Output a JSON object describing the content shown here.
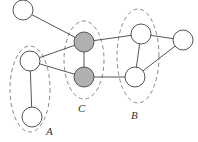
{
  "diagram": {
    "type": "graph",
    "nodes": [
      {
        "id": "n0",
        "x": 23,
        "y": 10,
        "r": 10,
        "fill": "#ffffff",
        "group": null
      },
      {
        "id": "a1",
        "x": 30,
        "y": 61,
        "r": 10,
        "fill": "#ffffff",
        "group": "A"
      },
      {
        "id": "a2",
        "x": 32,
        "y": 117,
        "r": 10,
        "fill": "#ffffff",
        "group": "A"
      },
      {
        "id": "c1",
        "x": 84,
        "y": 42,
        "r": 10,
        "fill": "#b0b0b0",
        "group": "C"
      },
      {
        "id": "c2",
        "x": 84,
        "y": 77,
        "r": 10,
        "fill": "#b0b0b0",
        "group": "C"
      },
      {
        "id": "b1",
        "x": 141,
        "y": 34,
        "r": 10,
        "fill": "#ffffff",
        "group": "B"
      },
      {
        "id": "b2",
        "x": 135,
        "y": 77,
        "r": 10,
        "fill": "#ffffff",
        "group": "B"
      },
      {
        "id": "n7",
        "x": 183,
        "y": 40,
        "r": 10,
        "fill": "#ffffff",
        "group": null
      }
    ],
    "edges": [
      [
        "n0",
        "c1"
      ],
      [
        "a1",
        "c1"
      ],
      [
        "a1",
        "c2"
      ],
      [
        "a1",
        "a2"
      ],
      [
        "c1",
        "c2"
      ],
      [
        "c1",
        "b1"
      ],
      [
        "c2",
        "b2"
      ],
      [
        "b1",
        "b2"
      ],
      [
        "b1",
        "n7"
      ],
      [
        "b2",
        "n7"
      ]
    ],
    "groups": [
      {
        "label": "A",
        "cx": 30,
        "cy": 89,
        "rx": 20,
        "ry": 43
      },
      {
        "label": "C",
        "cx": 84,
        "cy": 60,
        "rx": 20,
        "ry": 39
      },
      {
        "label": "B",
        "cx": 138,
        "cy": 56,
        "rx": 21,
        "ry": 47
      }
    ],
    "labels": {
      "A": "A",
      "B": "B",
      "C": "C"
    }
  }
}
